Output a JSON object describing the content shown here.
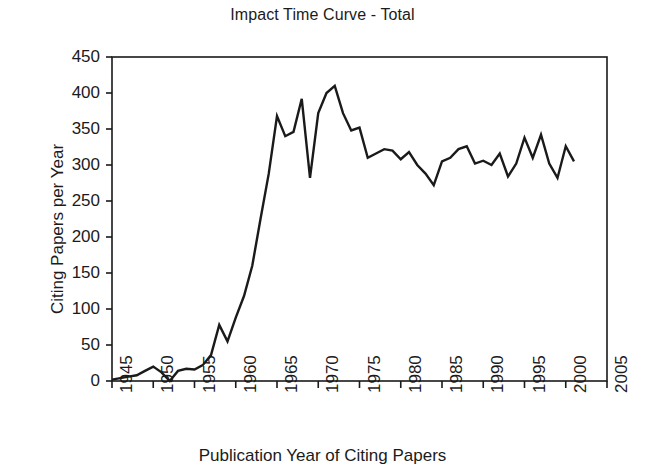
{
  "chart_data": {
    "type": "line",
    "title": "Impact Time Curve - Total",
    "xlabel": "Publication Year of Citing Papers",
    "ylabel": "Citing Papers per Year",
    "xlim": [
      1945,
      2005
    ],
    "ylim": [
      0,
      450
    ],
    "ytick_labels": [
      "0",
      "50",
      "100",
      "150",
      "200",
      "250",
      "300",
      "350",
      "400",
      "450"
    ],
    "yticks": [
      0,
      50,
      100,
      150,
      200,
      250,
      300,
      350,
      400,
      450
    ],
    "xtick_labels": [
      "1945",
      "1950",
      "1955",
      "1960",
      "1965",
      "1970",
      "1975",
      "1980",
      "1985",
      "1990",
      "1995",
      "2000",
      "2005"
    ],
    "xticks": [
      1945,
      1950,
      1955,
      1960,
      1965,
      1970,
      1975,
      1980,
      1985,
      1990,
      1995,
      2000,
      2005
    ],
    "grid": false,
    "legend": false,
    "line_color": "#1a1a1a",
    "line_width": 2.4,
    "x": [
      1945,
      1946,
      1947,
      1948,
      1949,
      1950,
      1951,
      1952,
      1953,
      1954,
      1955,
      1956,
      1957,
      1958,
      1959,
      1960,
      1961,
      1962,
      1963,
      1964,
      1965,
      1966,
      1967,
      1968,
      1969,
      1970,
      1971,
      1972,
      1973,
      1974,
      1975,
      1976,
      1977,
      1978,
      1979,
      1980,
      1981,
      1982,
      1983,
      1984,
      1985,
      1986,
      1987,
      1988,
      1989,
      1990,
      1991,
      1992,
      1993,
      1994,
      1995,
      1996,
      1997,
      1998,
      1999,
      2000,
      2001,
      2002,
      2003,
      2004
    ],
    "y": [
      2,
      4,
      6,
      8,
      14,
      20,
      12,
      0,
      14,
      17,
      16,
      22,
      36,
      78,
      55,
      88,
      118,
      160,
      225,
      288,
      368,
      340,
      346,
      392,
      282,
      372,
      400,
      410,
      372,
      348,
      352,
      310,
      316,
      322,
      320,
      308,
      318,
      300,
      288,
      272,
      305,
      310,
      322,
      326,
      302,
      306,
      300,
      316,
      284,
      302,
      338,
      310,
      342,
      302,
      282,
      326,
      305
    ]
  }
}
